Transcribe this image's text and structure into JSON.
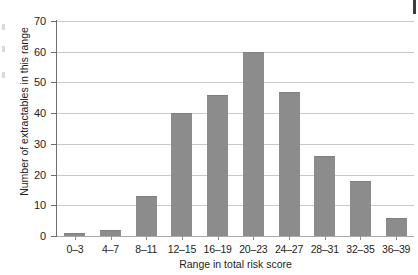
{
  "chart_data": {
    "type": "bar",
    "title": "",
    "xlabel": "Range in total risk score",
    "ylabel": "Number of extractables in this range",
    "categories": [
      "0–3",
      "4–7",
      "8–11",
      "12–15",
      "16–19",
      "20–23",
      "24–27",
      "28–31",
      "32–35",
      "36–39"
    ],
    "values": [
      1,
      2,
      13,
      40,
      46,
      60,
      47,
      26,
      18,
      6
    ],
    "ylim": [
      0,
      70
    ],
    "yticks": [
      0,
      10,
      20,
      30,
      40,
      50,
      60,
      70
    ],
    "ytick_labels": [
      "0",
      "10",
      "20",
      "30",
      "40",
      "50",
      "60",
      "70"
    ],
    "grid": true,
    "legend": "none",
    "bar_color": "#8c8c8c",
    "grid_color": "#c9c9c9",
    "axis_color": "#6e6e6e",
    "background": "#ffffff"
  }
}
